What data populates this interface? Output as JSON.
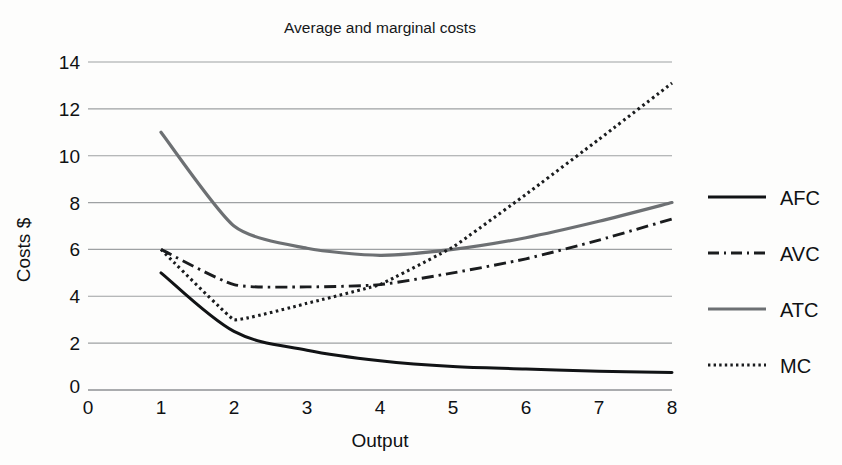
{
  "figure": {
    "title": "Average and marginal costs",
    "background_color": "#fdfdfc",
    "ink_color": "#16181a",
    "grid_color": "#8e9194"
  },
  "axes": {
    "x": {
      "label": "Output",
      "ticks": [
        "0",
        "1",
        "2",
        "3",
        "4",
        "5",
        "6",
        "7",
        "8"
      ],
      "min": 0,
      "max": 8
    },
    "y": {
      "label": "Costs $",
      "ticks": [
        "0",
        "2",
        "4",
        "6",
        "8",
        "10",
        "12",
        "14"
      ],
      "min": 0,
      "max": 14
    }
  },
  "legend": {
    "position": "right",
    "items": [
      {
        "label": "AFC",
        "style": "solid-black",
        "color": "#111315"
      },
      {
        "label": "AVC",
        "style": "dash-dot",
        "color": "#1a1c1e"
      },
      {
        "label": "ATC",
        "style": "solid-gray",
        "color": "#6d7073"
      },
      {
        "label": "MC",
        "style": "dotted",
        "color": "#1a1c1e"
      }
    ]
  },
  "chart_data": {
    "type": "line",
    "title": "Average and marginal costs",
    "xlabel": "Output",
    "ylabel": "Costs $",
    "xlim": [
      0,
      8
    ],
    "ylim": [
      0,
      14
    ],
    "xticks": [
      0,
      1,
      2,
      3,
      4,
      5,
      6,
      7,
      8
    ],
    "yticks": [
      0,
      2,
      4,
      6,
      8,
      10,
      12,
      14
    ],
    "grid": "horizontal",
    "legend_position": "right",
    "x": [
      1,
      2,
      3,
      4,
      5,
      6,
      7,
      8
    ],
    "series": [
      {
        "name": "AFC",
        "linestyle": "solid",
        "color": "#111315",
        "values": [
          5.0,
          2.5,
          1.7,
          1.25,
          1.0,
          0.9,
          0.8,
          0.75
        ]
      },
      {
        "name": "AVC",
        "linestyle": "dashdot",
        "color": "#1a1c1e",
        "values": [
          6.0,
          4.5,
          4.4,
          4.5,
          5.0,
          5.6,
          6.4,
          7.3
        ]
      },
      {
        "name": "ATC",
        "linestyle": "solid",
        "color": "#6d7073",
        "values": [
          11.0,
          7.0,
          6.05,
          5.75,
          6.0,
          6.5,
          7.2,
          8.0
        ]
      },
      {
        "name": "MC",
        "linestyle": "dotted",
        "color": "#1a1c1e",
        "values": [
          6.0,
          3.0,
          3.7,
          4.5,
          6.1,
          8.35,
          10.7,
          13.1
        ]
      }
    ]
  }
}
